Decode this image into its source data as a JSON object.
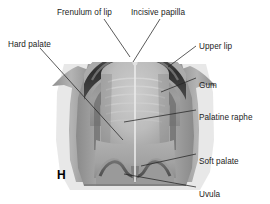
{
  "figure": {
    "panel_letter": "H",
    "style": "grayscale anatomical photograph"
  },
  "colors": {
    "background": "#ffffff",
    "text": "#1c1c1c",
    "leader_line": "#242424",
    "cheek_light": "#b9b9b9",
    "cheek_mid": "#9a9a9a",
    "lip_dark": "#3a3a3a",
    "lip_band": "#6e6e6e",
    "gum_mid": "#8f8f8f",
    "palate_light": "#c3c3c3",
    "palate_mid": "#a8a8a8",
    "soft_palate": "#9c9c9c",
    "raphe_line": "#e8e8e8",
    "rugae_line": "#d2d2d2"
  },
  "labels": [
    {
      "id": "frenulum-of-lip",
      "text": "Frenulum of lip",
      "x": 57,
      "y": 8,
      "anchor": "start"
    },
    {
      "id": "incisive-papilla",
      "text": "Incisive papilla",
      "x": 131,
      "y": 8,
      "anchor": "start"
    },
    {
      "id": "hard-palate",
      "text": "Hard palate",
      "x": 8,
      "y": 40,
      "anchor": "start"
    },
    {
      "id": "upper-lip",
      "text": "Upper lip",
      "x": 199,
      "y": 42,
      "anchor": "start"
    },
    {
      "id": "gum",
      "text": "Gum",
      "x": 199,
      "y": 81,
      "anchor": "start"
    },
    {
      "id": "palatine-raphe",
      "text": "Palatine raphe",
      "x": 199,
      "y": 113,
      "anchor": "start"
    },
    {
      "id": "soft-palate",
      "text": "Soft palate",
      "x": 199,
      "y": 157,
      "anchor": "start"
    },
    {
      "id": "uvula",
      "text": "Uvula",
      "x": 199,
      "y": 190,
      "anchor": "start"
    }
  ],
  "panel_letter_pos": {
    "x": 57,
    "y": 168
  },
  "leaders": [
    {
      "id": "frenulum-of-lip-leader",
      "points": "104,19 130,57"
    },
    {
      "id": "incisive-papilla-leader",
      "points": "160,19 133,62"
    },
    {
      "id": "hard-palate-leader",
      "points": "40,48 123,140"
    },
    {
      "id": "upper-lip-leader",
      "points": "196,46 168,67"
    },
    {
      "id": "gum-leader",
      "points": "196,78 161,92"
    },
    {
      "id": "palatine-raphe-leader",
      "points": "196,110 124,122"
    },
    {
      "id": "soft-palate-leader",
      "points": "196,154 141,166"
    },
    {
      "id": "uvula-leader",
      "points": "196,187 124,174"
    }
  ]
}
